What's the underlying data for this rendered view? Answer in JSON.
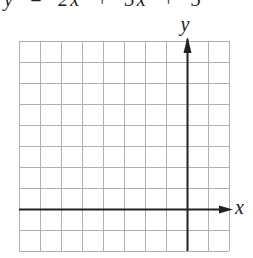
{
  "header": {
    "cropped_text": "y  =  2x  +  3x  +  5"
  },
  "diagram": {
    "type": "coordinate-grid",
    "grid": {
      "left": 19,
      "top": 41,
      "cols": 10,
      "rows": 10,
      "cell": 21,
      "color": "#b0b0b0"
    },
    "axes": {
      "x_label": "x",
      "y_label": "y",
      "color": "#222222",
      "y_axis_col": 8,
      "x_axis_row": 8
    }
  }
}
